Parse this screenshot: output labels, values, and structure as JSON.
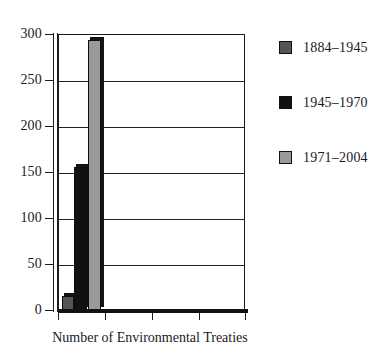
{
  "chart_data": {
    "type": "bar",
    "title": "",
    "xlabel": "Number of Environmental Treaties",
    "ylabel": "",
    "ylim": [
      0,
      300
    ],
    "yticks": [
      0,
      50,
      100,
      150,
      200,
      250,
      300
    ],
    "ytick_labels": [
      "0",
      "50",
      "100",
      "150",
      "200",
      "250",
      "300"
    ],
    "grid": true,
    "legend_position": "right",
    "categories": [
      "Number of Environmental Treaties"
    ],
    "series": [
      {
        "name": "1884–1945",
        "values": [
          15
        ],
        "color": "#555555"
      },
      {
        "name": "1945–1970",
        "values": [
          156
        ],
        "color": "#111111"
      },
      {
        "name": "1971–2004",
        "values": [
          294
        ],
        "color": "#9a9a9a"
      }
    ]
  },
  "axis": {
    "y_ticks": [
      {
        "label": "300",
        "value": 300
      },
      {
        "label": "250",
        "value": 250
      },
      {
        "label": "200",
        "value": 200
      },
      {
        "label": "150",
        "value": 150
      },
      {
        "label": "100",
        "value": 100
      },
      {
        "label": "50",
        "value": 50
      },
      {
        "label": "0",
        "value": 0
      }
    ],
    "x_title": "Number of Environmental Treaties"
  },
  "legend": {
    "items": [
      {
        "label": "1884–1945",
        "color": "#555555"
      },
      {
        "label": "1945–1970",
        "color": "#111111"
      },
      {
        "label": "1971–2004",
        "color": "#9a9a9a"
      }
    ]
  }
}
